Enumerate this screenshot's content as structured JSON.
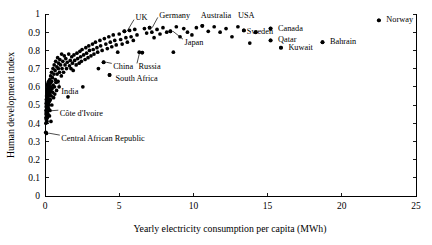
{
  "chart_data": {
    "type": "scatter",
    "title": "",
    "xlabel": "Yearly electricity consumption per capita (MWh)",
    "ylabel": "Human development index",
    "xlim": [
      0,
      25
    ],
    "ylim": [
      0,
      1
    ],
    "xticks": [
      0,
      5,
      10,
      15,
      20,
      25
    ],
    "xtick_labels": [
      "0",
      "5",
      "10",
      "15",
      "20",
      "25"
    ],
    "yticks": [
      0,
      0.1,
      0.2,
      0.3,
      0.4,
      0.5,
      0.6,
      0.7,
      0.8,
      0.9,
      1
    ],
    "ytick_labels": [
      "0",
      "0.1",
      "0.2",
      "0.3",
      "0.4",
      "0.5",
      "0.6",
      "0.7",
      "0.8",
      "0.9",
      "1"
    ],
    "grid": false,
    "legend": "none",
    "marker": "filled-circle",
    "marker_color": "#000000",
    "annotations": [
      {
        "name": "UK",
        "label": "UK",
        "x": 5.35,
        "y": 0.905,
        "label_x": 6.1,
        "label_y": 0.983,
        "leader": true
      },
      {
        "name": "Germany",
        "label": "Germany",
        "x": 7.05,
        "y": 0.925,
        "label_x": 7.7,
        "label_y": 0.995,
        "leader": true
      },
      {
        "name": "Australia",
        "label": "Australia",
        "x": 10.6,
        "y": 0.935,
        "label_x": 10.5,
        "label_y": 0.995,
        "leader": false
      },
      {
        "name": "USA",
        "label": "USA",
        "x": 13.4,
        "y": 0.91,
        "label_x": 13.0,
        "label_y": 0.995,
        "leader": false
      },
      {
        "name": "Canada",
        "label": "Canada",
        "x": 15.2,
        "y": 0.92,
        "label_x": 15.7,
        "label_y": 0.925,
        "leader": false
      },
      {
        "name": "Norway",
        "label": "Norway",
        "x": 22.5,
        "y": 0.965,
        "label_x": 23.0,
        "label_y": 0.97,
        "leader": false
      },
      {
        "name": "Sweden",
        "label": "Sweden",
        "x": 14.2,
        "y": 0.9,
        "label_x": 13.6,
        "label_y": 0.905,
        "leader": false
      },
      {
        "name": "Qatar",
        "label": "Qatar",
        "x": 15.2,
        "y": 0.855,
        "label_x": 15.7,
        "label_y": 0.86,
        "leader": false
      },
      {
        "name": "Kuwait",
        "label": "Kuwait",
        "x": 15.9,
        "y": 0.815,
        "label_x": 16.4,
        "label_y": 0.82,
        "leader": false
      },
      {
        "name": "Bahrain",
        "label": "Bahrain",
        "x": 18.7,
        "y": 0.845,
        "label_x": 19.2,
        "label_y": 0.85,
        "leader": false
      },
      {
        "name": "Japan",
        "label": "Japan",
        "x": 8.45,
        "y": 0.905,
        "label_x": 9.4,
        "label_y": 0.845,
        "leader": true
      },
      {
        "name": "China",
        "label": "China",
        "x": 3.95,
        "y": 0.735,
        "label_x": 4.6,
        "label_y": 0.712,
        "leader": true
      },
      {
        "name": "Russia",
        "label": "Russia",
        "x": 6.55,
        "y": 0.788,
        "label_x": 6.3,
        "label_y": 0.712,
        "leader": true
      },
      {
        "name": "South Africa",
        "label": "South Africa",
        "x": 4.35,
        "y": 0.665,
        "label_x": 4.75,
        "label_y": 0.648,
        "leader": false
      },
      {
        "name": "India",
        "label": "India",
        "x": 0.75,
        "y": 0.625,
        "label_x": 1.1,
        "label_y": 0.577,
        "leader": true
      },
      {
        "name": "Cote d'Ivoire",
        "label": "Côte d'Ivoire",
        "x": 0.18,
        "y": 0.468,
        "label_x": 1.0,
        "label_y": 0.455,
        "leader": true
      },
      {
        "name": "Central African Republic",
        "label": "Central African Republic",
        "x": 0.1,
        "y": 0.345,
        "label_x": 1.1,
        "label_y": 0.318,
        "leader": true
      }
    ],
    "points": [
      [
        0.05,
        0.35
      ],
      [
        0.06,
        0.4
      ],
      [
        0.06,
        0.43
      ],
      [
        0.07,
        0.45
      ],
      [
        0.07,
        0.47
      ],
      [
        0.08,
        0.49
      ],
      [
        0.08,
        0.51
      ],
      [
        0.09,
        0.42
      ],
      [
        0.09,
        0.53
      ],
      [
        0.1,
        0.46
      ],
      [
        0.1,
        0.5
      ],
      [
        0.11,
        0.55
      ],
      [
        0.11,
        0.44
      ],
      [
        0.12,
        0.48
      ],
      [
        0.12,
        0.52
      ],
      [
        0.13,
        0.57
      ],
      [
        0.13,
        0.41
      ],
      [
        0.14,
        0.54
      ],
      [
        0.14,
        0.46
      ],
      [
        0.15,
        0.5
      ],
      [
        0.15,
        0.59
      ],
      [
        0.16,
        0.43
      ],
      [
        0.16,
        0.56
      ],
      [
        0.17,
        0.52
      ],
      [
        0.17,
        0.61
      ],
      [
        0.18,
        0.47
      ],
      [
        0.18,
        0.58
      ],
      [
        0.19,
        0.54
      ],
      [
        0.19,
        0.49
      ],
      [
        0.2,
        0.62
      ],
      [
        0.2,
        0.45
      ],
      [
        0.21,
        0.57
      ],
      [
        0.22,
        0.51
      ],
      [
        0.22,
        0.6
      ],
      [
        0.23,
        0.55
      ],
      [
        0.24,
        0.48
      ],
      [
        0.25,
        0.63
      ],
      [
        0.25,
        0.53
      ],
      [
        0.26,
        0.58
      ],
      [
        0.27,
        0.5
      ],
      [
        0.28,
        0.61
      ],
      [
        0.29,
        0.56
      ],
      [
        0.3,
        0.44
      ],
      [
        0.3,
        0.52
      ],
      [
        0.31,
        0.59
      ],
      [
        0.32,
        0.64
      ],
      [
        0.33,
        0.47
      ],
      [
        0.34,
        0.57
      ],
      [
        0.35,
        0.62
      ],
      [
        0.36,
        0.53
      ],
      [
        0.38,
        0.66
      ],
      [
        0.39,
        0.58
      ],
      [
        0.4,
        0.41
      ],
      [
        0.41,
        0.6
      ],
      [
        0.42,
        0.55
      ],
      [
        0.44,
        0.68
      ],
      [
        0.45,
        0.63
      ],
      [
        0.46,
        0.5
      ],
      [
        0.48,
        0.59
      ],
      [
        0.5,
        0.65
      ],
      [
        0.52,
        0.57
      ],
      [
        0.54,
        0.7
      ],
      [
        0.55,
        0.61
      ],
      [
        0.58,
        0.54
      ],
      [
        0.6,
        0.67
      ],
      [
        0.62,
        0.72
      ],
      [
        0.64,
        0.6
      ],
      [
        0.66,
        0.56
      ],
      [
        0.68,
        0.69
      ],
      [
        0.7,
        0.64
      ],
      [
        0.72,
        0.74
      ],
      [
        0.75,
        0.625
      ],
      [
        0.78,
        0.58
      ],
      [
        0.8,
        0.71
      ],
      [
        0.82,
        0.67
      ],
      [
        0.85,
        0.76
      ],
      [
        0.88,
        0.63
      ],
      [
        0.9,
        0.7
      ],
      [
        0.92,
        0.73
      ],
      [
        0.95,
        0.6
      ],
      [
        0.98,
        0.68
      ],
      [
        1.0,
        0.75
      ],
      [
        1.05,
        0.72
      ],
      [
        1.1,
        0.66
      ],
      [
        1.12,
        0.78
      ],
      [
        1.15,
        0.7
      ],
      [
        1.2,
        0.74
      ],
      [
        1.25,
        0.68
      ],
      [
        1.3,
        0.77
      ],
      [
        1.35,
        0.72
      ],
      [
        1.4,
        0.755
      ],
      [
        1.45,
        0.7
      ],
      [
        1.5,
        0.735
      ],
      [
        1.55,
        0.545
      ],
      [
        1.6,
        0.78
      ],
      [
        1.65,
        0.715
      ],
      [
        1.7,
        0.745
      ],
      [
        1.75,
        0.7
      ],
      [
        1.8,
        0.765
      ],
      [
        1.85,
        0.73
      ],
      [
        1.9,
        0.69
      ],
      [
        1.95,
        0.775
      ],
      [
        2.0,
        0.745
      ],
      [
        2.1,
        0.72
      ],
      [
        2.15,
        0.785
      ],
      [
        2.2,
        0.755
      ],
      [
        2.3,
        0.73
      ],
      [
        2.35,
        0.795
      ],
      [
        2.4,
        0.765
      ],
      [
        2.45,
        0.74
      ],
      [
        2.5,
        0.805
      ],
      [
        2.55,
        0.6
      ],
      [
        2.6,
        0.775
      ],
      [
        2.7,
        0.75
      ],
      [
        2.75,
        0.815
      ],
      [
        2.8,
        0.785
      ],
      [
        2.9,
        0.76
      ],
      [
        2.95,
        0.825
      ],
      [
        3.0,
        0.8
      ],
      [
        3.1,
        0.77
      ],
      [
        3.2,
        0.835
      ],
      [
        3.25,
        0.805
      ],
      [
        3.3,
        0.78
      ],
      [
        3.4,
        0.845
      ],
      [
        3.5,
        0.815
      ],
      [
        3.55,
        0.79
      ],
      [
        3.6,
        0.7
      ],
      [
        3.7,
        0.855
      ],
      [
        3.75,
        0.825
      ],
      [
        3.85,
        0.8
      ],
      [
        3.95,
        0.735
      ],
      [
        4.0,
        0.865
      ],
      [
        4.1,
        0.835
      ],
      [
        4.2,
        0.81
      ],
      [
        4.3,
        0.875
      ],
      [
        4.35,
        0.665
      ],
      [
        4.4,
        0.845
      ],
      [
        4.5,
        0.82
      ],
      [
        4.6,
        0.885
      ],
      [
        4.7,
        0.855
      ],
      [
        4.8,
        0.83
      ],
      [
        4.9,
        0.79
      ],
      [
        5.0,
        0.89
      ],
      [
        5.1,
        0.86
      ],
      [
        5.2,
        0.835
      ],
      [
        5.35,
        0.905
      ],
      [
        5.45,
        0.87
      ],
      [
        5.55,
        0.845
      ],
      [
        5.7,
        0.91
      ],
      [
        5.8,
        0.875
      ],
      [
        5.95,
        0.855
      ],
      [
        6.05,
        0.915
      ],
      [
        6.2,
        0.885
      ],
      [
        6.35,
        0.79
      ],
      [
        6.55,
        0.788
      ],
      [
        6.7,
        0.92
      ],
      [
        6.85,
        0.895
      ],
      [
        7.05,
        0.925
      ],
      [
        7.2,
        0.9
      ],
      [
        7.35,
        0.87
      ],
      [
        7.55,
        0.915
      ],
      [
        7.75,
        0.89
      ],
      [
        7.95,
        0.925
      ],
      [
        8.2,
        0.9
      ],
      [
        8.45,
        0.905
      ],
      [
        8.65,
        0.79
      ],
      [
        8.85,
        0.93
      ],
      [
        9.1,
        0.875
      ],
      [
        9.35,
        0.92
      ],
      [
        9.6,
        0.9
      ],
      [
        9.9,
        0.885
      ],
      [
        10.2,
        0.925
      ],
      [
        10.6,
        0.935
      ],
      [
        11.0,
        0.905
      ],
      [
        11.4,
        0.93
      ],
      [
        11.8,
        0.9
      ],
      [
        12.2,
        0.92
      ],
      [
        12.6,
        0.875
      ],
      [
        13.0,
        0.93
      ],
      [
        13.4,
        0.91
      ],
      [
        13.8,
        0.84
      ],
      [
        14.2,
        0.9
      ],
      [
        15.2,
        0.92
      ],
      [
        15.2,
        0.855
      ],
      [
        15.9,
        0.815
      ],
      [
        18.7,
        0.845
      ],
      [
        22.5,
        0.965
      ]
    ]
  }
}
